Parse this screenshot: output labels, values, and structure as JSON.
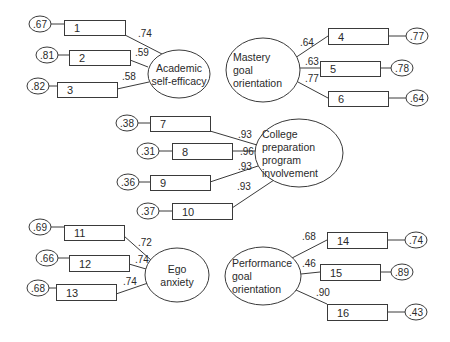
{
  "diagram": {
    "factors": [
      {
        "id": "academic",
        "label_lines": [
          "Academic",
          "self-efficacy"
        ],
        "cx": 179,
        "cy": 74,
        "rx": 31,
        "ry": 24,
        "indicators": [
          {
            "label": "1",
            "loading": ".74",
            "error": ".67",
            "box": [
              64,
              20,
              61,
              15
            ],
            "err_c": [
              40,
              24
            ],
            "load_xy": [
              138,
              37
            ],
            "anchor": [
              125,
              35
            ],
            "target": [
              162,
              54
            ]
          },
          {
            "label": "2",
            "loading": ".59",
            "error": ".81",
            "box": [
              69,
              50,
              61,
              15
            ],
            "err_c": [
              47,
              55
            ],
            "load_xy": [
              135,
              56
            ],
            "anchor": [
              130,
              60
            ],
            "target": [
              148,
              67
            ]
          },
          {
            "label": "3",
            "loading": ".58",
            "error": ".82",
            "box": [
              57,
              82,
              60,
              15
            ],
            "err_c": [
              38,
              86
            ],
            "load_xy": [
              122,
              80
            ],
            "anchor": [
              117,
              89
            ],
            "target": [
              149,
              82
            ]
          }
        ]
      },
      {
        "id": "mastery",
        "label_lines": [
          "Mastery",
          "goal",
          "orientation"
        ],
        "cx": 263,
        "cy": 70,
        "rx": 37,
        "ry": 32,
        "indicators": [
          {
            "label": "4",
            "loading": ".64",
            "error": ".77",
            "box": [
              328,
              28,
              60,
              16
            ],
            "err_c": [
              417,
              36
            ],
            "load_xy": [
              300,
              46
            ],
            "anchor": [
              328,
              36
            ],
            "target": [
              295,
              58
            ]
          },
          {
            "label": "5",
            "loading": ".63",
            "error": ".78",
            "box": [
              320,
              61,
              60,
              15
            ],
            "err_c": [
              402,
              68
            ],
            "load_xy": [
              305,
              65
            ],
            "anchor": [
              320,
              68
            ],
            "target": [
              300,
              68
            ]
          },
          {
            "label": "6",
            "loading": ".77",
            "error": ".64",
            "box": [
              328,
              91,
              60,
              15
            ],
            "err_c": [
              417,
              98
            ],
            "load_xy": [
              305,
              82
            ],
            "anchor": [
              328,
              98
            ],
            "target": [
              298,
              82
            ]
          }
        ]
      },
      {
        "id": "college",
        "label_lines": [
          "College",
          "preparation",
          "program",
          "involvement"
        ],
        "cx": 299,
        "cy": 153,
        "rx": 44,
        "ry": 34,
        "indicators": [
          {
            "label": "7",
            "loading": ".93",
            "error": ".38",
            "box": [
              150,
              116,
              60,
              15
            ],
            "err_c": [
              127,
              123
            ],
            "load_xy": [
              238,
              138
            ],
            "anchor": [
              210,
              131
            ],
            "target": [
              257,
              145
            ]
          },
          {
            "label": "8",
            "loading": ".96",
            "error": ".31",
            "box": [
              172,
              143,
              60,
              16
            ],
            "err_c": [
              148,
              151
            ],
            "load_xy": [
              240,
              155
            ],
            "anchor": [
              232,
              151
            ],
            "target": [
              256,
              151
            ]
          },
          {
            "label": "9",
            "loading": ".93",
            "error": ".36",
            "box": [
              150,
              175,
              60,
              15
            ],
            "err_c": [
              128,
              182
            ],
            "load_xy": [
              238,
              170
            ],
            "anchor": [
              210,
              182
            ],
            "target": [
              258,
              166
            ]
          },
          {
            "label": "10",
            "loading": ".93",
            "error": ".37",
            "box": [
              172,
              203,
              60,
              16
            ],
            "err_c": [
              148,
              211
            ],
            "load_xy": [
              237,
              190
            ],
            "anchor": [
              232,
              208
            ],
            "target": [
              274,
              180
            ]
          }
        ]
      },
      {
        "id": "ego",
        "label_lines": [
          "Ego",
          "anxiety"
        ],
        "cx": 177,
        "cy": 275,
        "rx": 32,
        "ry": 27,
        "indicators": [
          {
            "label": "11",
            "loading": ".72",
            "error": ".69",
            "box": [
              64,
              225,
              60,
              15
            ],
            "err_c": [
              40,
              227
            ],
            "load_xy": [
              138,
              246
            ],
            "anchor": [
              124,
              236
            ],
            "target": [
              151,
              260
            ]
          },
          {
            "label": "12",
            "loading": ".74",
            "error": ".66",
            "box": [
              69,
              255,
              60,
              16
            ],
            "err_c": [
              47,
              258
            ],
            "load_xy": [
              135,
              263
            ],
            "anchor": [
              129,
              264
            ],
            "target": [
              146,
              269
            ]
          },
          {
            "label": "13",
            "loading": ".74",
            "error": ".68",
            "box": [
              56,
              284,
              60,
              16
            ],
            "err_c": [
              38,
              288
            ],
            "load_xy": [
              123,
              285
            ],
            "anchor": [
              116,
              294
            ],
            "target": [
              148,
              283
            ]
          }
        ]
      },
      {
        "id": "performance",
        "label_lines": [
          "Performance",
          "goal",
          "orientation"
        ],
        "cx": 263,
        "cy": 276,
        "rx": 38,
        "ry": 29,
        "indicators": [
          {
            "label": "14",
            "loading": ".68",
            "error": ".74",
            "box": [
              327,
              232,
              60,
              16
            ],
            "err_c": [
              416,
              240
            ],
            "load_xy": [
              302,
              240
            ],
            "anchor": [
              327,
              240
            ],
            "target": [
              292,
              258
            ]
          },
          {
            "label": "15",
            "loading": ".46",
            "error": ".89",
            "box": [
              320,
              264,
              60,
              16
            ],
            "err_c": [
              402,
              272
            ],
            "load_xy": [
              302,
              267
            ],
            "anchor": [
              320,
              272
            ],
            "target": [
              301,
              274
            ]
          },
          {
            "label": "16",
            "loading": ".90",
            "error": ".43",
            "box": [
              327,
              304,
              60,
              16
            ],
            "err_c": [
              416,
              312
            ],
            "load_xy": [
              316,
              296
            ],
            "anchor": [
              327,
              304
            ],
            "target": [
              296,
              290
            ]
          }
        ]
      }
    ],
    "colors": {
      "line": "#3a3a3a",
      "text": "#2a2a2a",
      "background": "#ffffff"
    }
  }
}
